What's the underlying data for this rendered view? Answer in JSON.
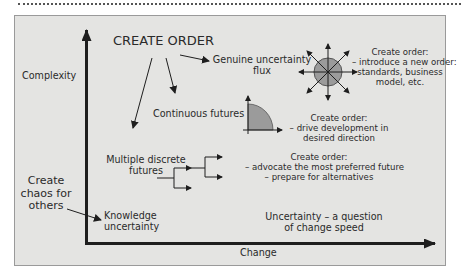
{
  "diagram": {
    "axes": {
      "y_label": "Complexity",
      "x_label": "Change"
    },
    "create_order_heading": "CREATE ORDER",
    "chaos_label": [
      "Create",
      "chaos for",
      "others"
    ],
    "nodes": {
      "genuine": [
        "Genuine uncertainty",
        "flux"
      ],
      "continuous": "Continuous futures",
      "multiple": [
        "Multiple discrete",
        "futures"
      ],
      "knowledge": [
        "Knowledge",
        "uncertainty"
      ]
    },
    "annotations": {
      "genuine": [
        "Create order:",
        "– introduce a new order:",
        "standards, business",
        "model, etc."
      ],
      "continuous": [
        "Create order:",
        "– drive development in",
        "desired direction"
      ],
      "multiple": [
        "Create order:",
        "– advocate the most preferred future",
        "– prepare for alternatives"
      ],
      "speed": [
        "Uncertainty – a question",
        "of change speed"
      ]
    },
    "colors": {
      "panel_bg": "#e4e4e2",
      "shape_fill": "#9b9b9b",
      "ink": "#1e1e1e"
    }
  }
}
